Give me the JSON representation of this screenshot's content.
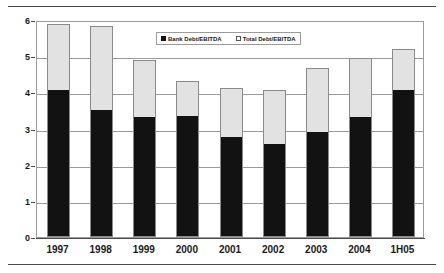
{
  "chart_data": {
    "type": "bar",
    "subtype": "stacked",
    "title": "",
    "xlabel": "",
    "ylabel": "",
    "ylim": [
      0,
      6
    ],
    "ytick_step": 1,
    "yticks": [
      "0",
      "1",
      "2",
      "3",
      "4",
      "5",
      "6"
    ],
    "grid": true,
    "legend_position": "top-center",
    "categories": [
      "1997",
      "1998",
      "1999",
      "2000",
      "2001",
      "2002",
      "2003",
      "2004",
      "1H05"
    ],
    "series": [
      {
        "name": "Bank Debt/EBITDA",
        "marker": "filled-square",
        "color": "#121212",
        "values": [
          4.07,
          3.52,
          3.31,
          3.35,
          2.76,
          2.58,
          2.9,
          3.33,
          4.07
        ]
      },
      {
        "name": "Total Debt/EBITDA",
        "marker": "hollow-square",
        "color": "#e2e2e2",
        "note": "stacked top segment; bar top equals total",
        "values": [
          5.9,
          5.83,
          4.9,
          4.32,
          4.13,
          4.07,
          4.68,
          4.95,
          5.2
        ]
      }
    ],
    "totals": [
      5.9,
      5.83,
      4.9,
      4.32,
      4.13,
      4.07,
      4.68,
      4.95,
      5.2
    ]
  },
  "legend": {
    "entries": [
      {
        "label": "Bank Debt/EBITDA"
      },
      {
        "label": "Total Debt/EBITDA"
      }
    ]
  },
  "colors": {
    "bank_fill": "#121212",
    "total_fill": "#e2e2e2",
    "bar_outline": "#8a8a8a",
    "gridline": "#9b9b9b",
    "axis": "#4a4a4a",
    "text": "#1a1a1a",
    "background": "#ffffff"
  }
}
